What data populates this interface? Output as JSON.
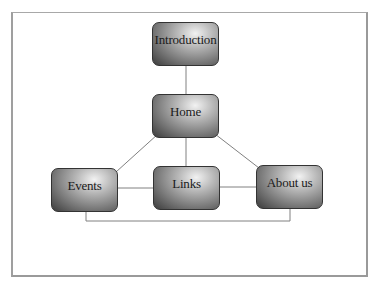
{
  "diagram": {
    "type": "site-map",
    "nodes": [
      {
        "id": "introduction",
        "label": "Introduction"
      },
      {
        "id": "home",
        "label": "Home"
      },
      {
        "id": "events",
        "label": "Events"
      },
      {
        "id": "links",
        "label": "Links"
      },
      {
        "id": "about",
        "label": "About us"
      }
    ],
    "edges": [
      [
        "introduction",
        "home"
      ],
      [
        "home",
        "events"
      ],
      [
        "home",
        "links"
      ],
      [
        "home",
        "about"
      ],
      [
        "events",
        "links"
      ],
      [
        "links",
        "about"
      ],
      [
        "events",
        "about"
      ]
    ],
    "colors": {
      "line": "#808080",
      "frame": "#a8a8a8",
      "node_dark": "#3c3c3c",
      "node_light": "#f2f2f2"
    }
  }
}
